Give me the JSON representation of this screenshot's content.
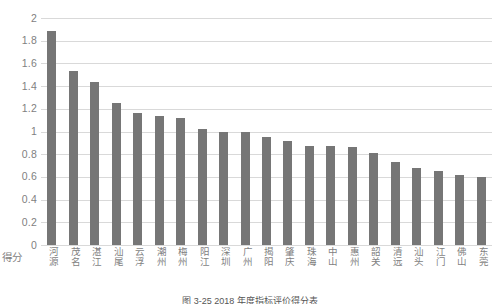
{
  "chart_data": {
    "type": "bar",
    "title": "",
    "caption": "图 3-25  2018 年度指标评价得分表",
    "xlabel": "",
    "ylabel": "得分",
    "ylim": [
      0,
      2
    ],
    "ytick_step": 0.2,
    "grid": true,
    "legend": "none",
    "bar_color": "#767676",
    "gridline_color": "#d9d9d9",
    "tick_label_color": "#7f7f7f",
    "ytick_labels": [
      "2",
      "1.8",
      "1.6",
      "1.4",
      "1.2",
      "1",
      "0.8",
      "0.6",
      "0.4",
      "0.2",
      "0"
    ],
    "ytick_values": [
      2,
      1.8,
      1.6,
      1.4,
      1.2,
      1,
      0.8,
      0.6,
      0.4,
      0.2,
      0
    ],
    "categories": [
      "河源",
      "茂名",
      "湛江",
      "汕尾",
      "云浮",
      "潮州",
      "梅州",
      "阳江",
      "深圳",
      "广州",
      "揭阳",
      "肇庆",
      "珠海",
      "中山",
      "惠州",
      "韶关",
      "清远",
      "汕头",
      "江门",
      "佛山",
      "东莞"
    ],
    "values": [
      1.89,
      1.53,
      1.44,
      1.25,
      1.16,
      1.14,
      1.12,
      1.02,
      1.0,
      1.0,
      0.95,
      0.92,
      0.87,
      0.87,
      0.86,
      0.81,
      0.73,
      0.68,
      0.65,
      0.62,
      0.6
    ]
  }
}
